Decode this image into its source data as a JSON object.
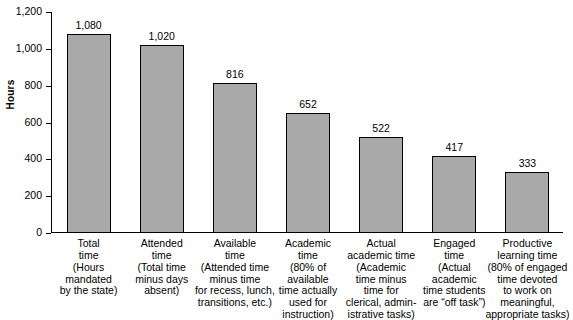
{
  "chart_data": {
    "type": "bar",
    "title": "",
    "xlabel": "",
    "ylabel": "Hours",
    "ylim": [
      0,
      1200
    ],
    "yticks": [
      "0",
      "200",
      "400",
      "600",
      "800",
      "1,000",
      "1,200"
    ],
    "grid": false,
    "legend": "none",
    "bar_color": "#a9a9a9",
    "bar_border_color": "#000000",
    "categories": [
      "Total\ntime",
      "Attended\ntime",
      "Available\ntime",
      "Academic\ntime",
      "Actual\nacademic time",
      "Engaged\ntime",
      "Productive\nlearning time"
    ],
    "category_notes": [
      "(Hours\nmandated\nby the state)",
      "(Total time\nminus days\nabsent)",
      "(Attended time\nminus time\nfor recess, lunch,\ntransitions, etc.)",
      "(80% of\navailable\ntime actually\nused for\ninstruction)",
      "(Academic\ntime minus\ntime for\nclerical, admin-\nistrative tasks)",
      "(Actual\nacademic\ntime students\nare “off task”)",
      "(80% of engaged\ntime devoted\nto work on\nmeaningful,\nappropriate tasks)"
    ],
    "values": [
      1080,
      1020,
      816,
      652,
      522,
      417,
      333
    ],
    "value_labels": [
      "1,080",
      "1,020",
      "816",
      "652",
      "522",
      "417",
      "333"
    ]
  }
}
